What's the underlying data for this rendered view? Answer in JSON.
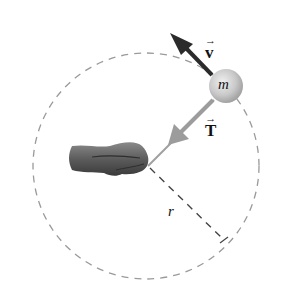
{
  "diagram": {
    "labels": {
      "mass": "m",
      "velocity": "v",
      "tension": "T",
      "radius": "r",
      "vector_arrow": "→"
    },
    "elements": {
      "path": "dashed circular path",
      "hand": "hand holding string at center",
      "ball": "mass m on circle",
      "velocity_arrow": "tangential velocity vector",
      "tension_arrow": "tension vector toward center",
      "radius_line": "dashed radius line"
    },
    "colors": {
      "circle_dash": "#9a9a9a",
      "velocity_arrow": "#2b2b2b",
      "tension_arrow": "#9c9c9c",
      "ball": "#c8c8c8",
      "hand": "#5a5a5a",
      "text": "#111111"
    }
  }
}
